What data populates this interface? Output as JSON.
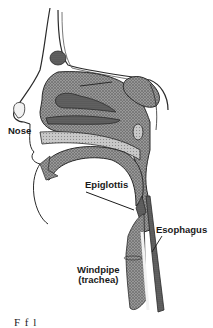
{
  "figure": {
    "type": "anatomical cross-section",
    "colors": {
      "background": "#ffffff",
      "stipple": "#6e6e6e",
      "outline": "#2a2a2a",
      "cavity": "#f2f2f2"
    }
  },
  "labels": {
    "nose": "Nose",
    "epiglottis": "Epiglottis",
    "esophagus": "Esophagus",
    "windpipe_line1": "Windpipe",
    "windpipe_line2": "(trachea)"
  },
  "caption": {
    "text": "F                    f  l          "
  }
}
